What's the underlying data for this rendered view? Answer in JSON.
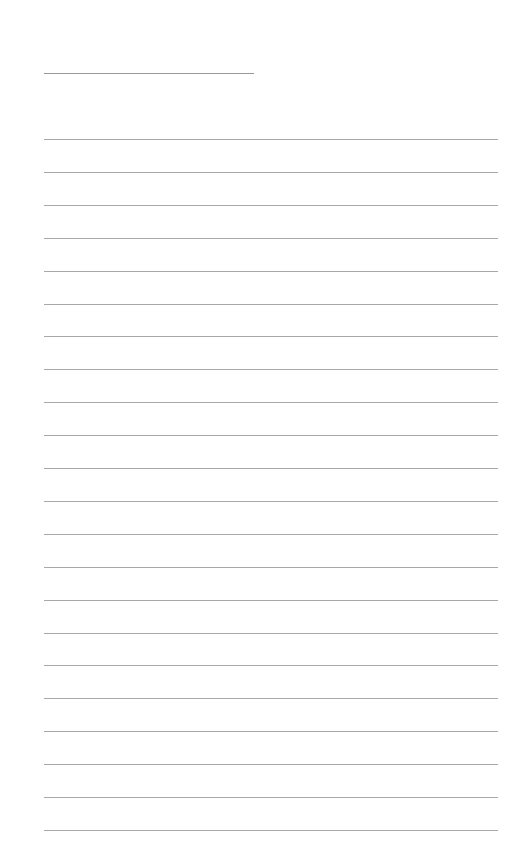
{
  "page": {
    "type": "lined-paper",
    "name_line": {
      "left": 44,
      "top": 73,
      "width": 210
    },
    "rules": {
      "count": 22,
      "first_top": 139,
      "spacing": 32.9,
      "left": 44,
      "width": 454
    },
    "colors": {
      "background": "#ffffff",
      "rule": "#a8a8a8"
    }
  }
}
